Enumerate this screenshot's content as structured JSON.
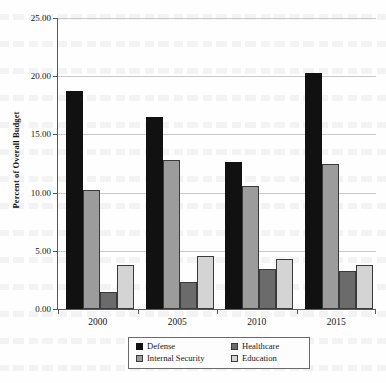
{
  "chart_data": {
    "type": "bar",
    "title": "",
    "xlabel": "",
    "ylabel": "Percent of Overall Budget",
    "categories": [
      "2000",
      "2005",
      "2010",
      "2015"
    ],
    "ylim": [
      0.0,
      25.0
    ],
    "ytick_labels": [
      "0.00",
      "5.00",
      "10.00",
      "15.00",
      "20.00",
      "25.00"
    ],
    "ytick_values": [
      0.0,
      5.0,
      10.0,
      15.0,
      20.0,
      25.0
    ],
    "grid": true,
    "legend_position": "bottom",
    "series": [
      {
        "name": "Defense",
        "color": "#111111",
        "values": [
          18.7,
          16.5,
          12.6,
          20.3
        ]
      },
      {
        "name": "Internal Security",
        "color": "#9c9c9c",
        "values": [
          10.2,
          12.8,
          10.6,
          12.5
        ]
      },
      {
        "name": "Healthcare",
        "color": "#6b6b6b",
        "values": [
          1.5,
          2.3,
          3.4,
          3.3
        ]
      },
      {
        "name": "Education",
        "color": "#d4d4d4",
        "values": [
          3.75,
          4.55,
          4.3,
          3.8
        ]
      }
    ],
    "legend_order": [
      "Defense",
      "Healthcare",
      "Internal Security",
      "Education"
    ]
  }
}
